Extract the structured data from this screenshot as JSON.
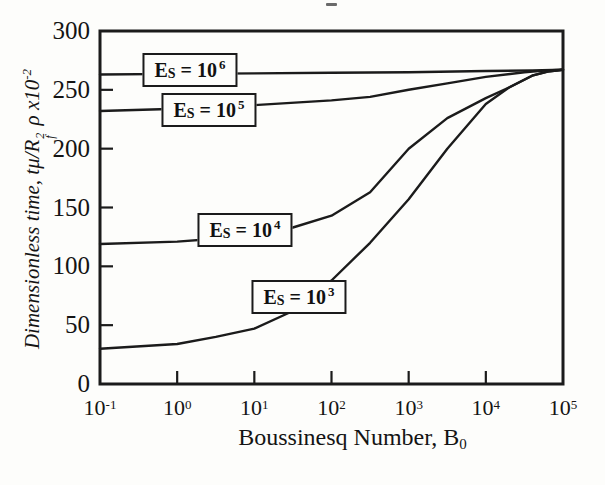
{
  "figure": {
    "background": "#fdfdfb",
    "ink_color": "#1b1b1b"
  },
  "chart_data": {
    "type": "line",
    "title": "",
    "xlabel": "Boussinesq Number, B0",
    "xlabel_parts": {
      "text": "Boussinesq Number, B",
      "sub": "0"
    },
    "ylabel": "Dimensionless time, tμ/Rf² ρ x10⁻²",
    "ylabel_parts": {
      "p1": "Dimensionless time, tμ/R",
      "r_sup": "2",
      "r_sub": "f",
      "p2": " ρ x10",
      "p2_sup": "-2"
    },
    "x_scale": "log",
    "xlim_log": [
      -1,
      5
    ],
    "ylim": [
      0,
      300
    ],
    "grid": false,
    "x_ticks": [
      {
        "base": "10",
        "exp": "-1",
        "log": -1
      },
      {
        "base": "10",
        "exp": "0",
        "log": 0
      },
      {
        "base": "10",
        "exp": "1",
        "log": 1
      },
      {
        "base": "10",
        "exp": "2",
        "log": 2
      },
      {
        "base": "10",
        "exp": "3",
        "log": 3
      },
      {
        "base": "10",
        "exp": "4",
        "log": 4
      },
      {
        "base": "10",
        "exp": "5",
        "log": 5
      }
    ],
    "y_ticks": [
      {
        "label": "300",
        "value": 300
      },
      {
        "label": "250",
        "value": 250
      },
      {
        "label": "200",
        "value": 200
      },
      {
        "label": "150",
        "value": 150
      },
      {
        "label": "100",
        "value": 100
      },
      {
        "label": "50",
        "value": 50
      },
      {
        "label": "0",
        "value": 0
      }
    ],
    "series": [
      {
        "name": "Es = 10^6",
        "label_parts": {
          "p1": "E",
          "sub": "S",
          "p2": " = 10",
          "exp": "6"
        },
        "label_box_px": [
          190,
          70
        ],
        "points": [
          [
            -1,
            263
          ],
          [
            0,
            263.5
          ],
          [
            1,
            264
          ],
          [
            2,
            264.5
          ],
          [
            3,
            265
          ],
          [
            4,
            266
          ],
          [
            4.6,
            266.5
          ],
          [
            5,
            267
          ]
        ]
      },
      {
        "name": "Es = 10^5",
        "label_parts": {
          "p1": "E",
          "sub": "S",
          "p2": " = 10",
          "exp": "5"
        },
        "label_box_px": [
          209,
          110
        ],
        "points": [
          [
            -1,
            232
          ],
          [
            0,
            234
          ],
          [
            1,
            237
          ],
          [
            2,
            241
          ],
          [
            2.5,
            244
          ],
          [
            3,
            250
          ],
          [
            3.5,
            255.5
          ],
          [
            4,
            261
          ],
          [
            4.5,
            265
          ],
          [
            4.8,
            266.5
          ],
          [
            5,
            267
          ]
        ]
      },
      {
        "name": "Es = 10^4",
        "label_parts": {
          "p1": "E",
          "sub": "S",
          "p2": " = 10",
          "exp": "4"
        },
        "label_box_px": [
          245,
          230
        ],
        "points": [
          [
            -1,
            119
          ],
          [
            0,
            121
          ],
          [
            0.5,
            123.5
          ],
          [
            1,
            127
          ],
          [
            1.5,
            133
          ],
          [
            2,
            143
          ],
          [
            2.5,
            163
          ],
          [
            3,
            200
          ],
          [
            3.5,
            226
          ],
          [
            4,
            243
          ],
          [
            4.3,
            252
          ],
          [
            4.6,
            262
          ],
          [
            4.8,
            265.5
          ],
          [
            5,
            267
          ]
        ]
      },
      {
        "name": "Es = 10^3",
        "label_parts": {
          "p1": "E",
          "sub": "S",
          "p2": " = 10",
          "exp": "3"
        },
        "label_box_px": [
          299,
          297
        ],
        "points": [
          [
            -1,
            30
          ],
          [
            0,
            34
          ],
          [
            0.5,
            40
          ],
          [
            1,
            47
          ],
          [
            1.5,
            62
          ],
          [
            2,
            88
          ],
          [
            2.5,
            120
          ],
          [
            3,
            157
          ],
          [
            3.5,
            200
          ],
          [
            4,
            238
          ],
          [
            4.3,
            252
          ],
          [
            4.6,
            262
          ],
          [
            4.8,
            265.5
          ],
          [
            5,
            267
          ]
        ]
      }
    ]
  }
}
